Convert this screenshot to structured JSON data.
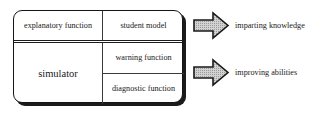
{
  "diagram": {
    "colors": {
      "box_border": "#151515",
      "box_shadow": "#1b1b1b",
      "divider": "#3a3a3a",
      "arrow_fill": "#cfcfcf",
      "arrow_outline": "#1a1a1a",
      "text": "#1a1a1a",
      "background": "#ffffff"
    },
    "left_column": {
      "explanatory_cell": "explanatory function",
      "simulator_cell": "simulator"
    },
    "right_column": {
      "student_model_cell": "student model",
      "warning_cell": "warning function",
      "diagnostic_cell": "diagnostic function"
    },
    "outcomes": [
      {
        "arrow_icon": "block-arrow-right-icon",
        "label": "imparting knowledge"
      },
      {
        "arrow_icon": "block-arrow-right-icon",
        "label": "improving abilities"
      }
    ]
  }
}
